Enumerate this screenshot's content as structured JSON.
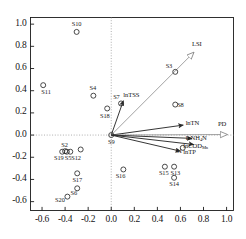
{
  "chart_data": {
    "type": "scatter",
    "title": "",
    "subtitle": "",
    "xlabel": "",
    "ylabel": "",
    "xlim": [
      -0.7,
      1.06
    ],
    "ylim": [
      -0.68,
      1.06
    ],
    "grid": "zero-axis dotted crosshair only",
    "legend": "none",
    "xticks": [
      "-0.6",
      "-0.4",
      "-0.2",
      "0.0",
      "0.2",
      "0.4",
      "0.6",
      "0.8",
      "1.0"
    ],
    "xtickvalues": [
      -0.6,
      -0.4,
      -0.2,
      0.0,
      0.2,
      0.4,
      0.6,
      0.8,
      1.0
    ],
    "yticks": [
      "1.0",
      "0.8",
      "0.6",
      "0.4",
      "0.2",
      "0.0",
      "-0.2",
      "-0.4",
      "-0.6"
    ],
    "ytickvalues": [
      1.0,
      0.8,
      0.6,
      0.4,
      0.2,
      0.0,
      -0.2,
      -0.4,
      -0.6
    ],
    "marker": "open-circle",
    "points": [
      {
        "label": "S10",
        "x": -0.3,
        "y": 0.93,
        "lx": -0.3,
        "ly": 1.0,
        "anchor": "center"
      },
      {
        "label": "S11",
        "x": -0.59,
        "y": 0.45,
        "lx": -0.565,
        "ly": 0.385,
        "anchor": "center"
      },
      {
        "label": "S4",
        "x": -0.155,
        "y": 0.355,
        "lx": -0.16,
        "ly": 0.425,
        "anchor": "center"
      },
      {
        "label": "S7",
        "x": 0.085,
        "y": 0.285,
        "lx": 0.045,
        "ly": 0.345,
        "anchor": "center"
      },
      {
        "label": "S18",
        "x": -0.035,
        "y": 0.24,
        "lx": -0.055,
        "ly": 0.175,
        "anchor": "center"
      },
      {
        "label": "S3",
        "x": 0.555,
        "y": 0.57,
        "lx": 0.5,
        "ly": 0.625,
        "anchor": "center"
      },
      {
        "label": "S8",
        "x": 0.555,
        "y": 0.275,
        "lx": 0.6,
        "ly": 0.275,
        "anchor": "center"
      },
      {
        "label": "S9",
        "x": 0.0,
        "y": 0.0,
        "lx": 0.0,
        "ly": -0.065,
        "anchor": "center"
      },
      {
        "label": "S1",
        "x": 0.62,
        "y": -0.115,
        "lx": 0.585,
        "ly": -0.145,
        "anchor": "center"
      },
      {
        "label": "S2",
        "x": -0.4,
        "y": -0.145,
        "lx": -0.405,
        "ly": -0.085,
        "anchor": "center"
      },
      {
        "label": "S19",
        "x": -0.425,
        "y": -0.15,
        "lx": -0.455,
        "ly": -0.205,
        "anchor": "center"
      },
      {
        "label": "S5",
        "x": -0.385,
        "y": -0.15,
        "lx": -0.375,
        "ly": -0.205,
        "anchor": "center"
      },
      {
        "label": "S12",
        "x": -0.355,
        "y": -0.15,
        "lx": -0.305,
        "ly": -0.205,
        "anchor": "center"
      },
      {
        "label": "S17",
        "x": -0.295,
        "y": -0.345,
        "lx": -0.295,
        "ly": -0.405,
        "anchor": "center"
      },
      {
        "label": "S16",
        "x": 0.105,
        "y": -0.31,
        "lx": 0.08,
        "ly": -0.37,
        "anchor": "center"
      },
      {
        "label": "S15",
        "x": 0.465,
        "y": -0.285,
        "lx": 0.455,
        "ly": -0.345,
        "anchor": "center"
      },
      {
        "label": "S13",
        "x": 0.545,
        "y": -0.285,
        "lx": 0.555,
        "ly": -0.345,
        "anchor": "center"
      },
      {
        "label": "S14",
        "x": 0.545,
        "y": -0.385,
        "lx": 0.545,
        "ly": -0.445,
        "anchor": "center"
      },
      {
        "label": "S6",
        "x": -0.295,
        "y": -0.48,
        "lx": -0.325,
        "ly": -0.525,
        "anchor": "center"
      },
      {
        "label": "S20",
        "x": -0.38,
        "y": -0.555,
        "lx": -0.445,
        "ly": -0.585,
        "anchor": "center"
      },
      {
        "label": "",
        "x": -0.265,
        "y": -0.13,
        "lx": -0.265,
        "ly": -0.13,
        "anchor": "center"
      }
    ],
    "extra_point_note": "unlabeled open circle right of the S2/S19/S5/S12 cluster",
    "vectors": [
      {
        "label": "lnTSS",
        "plain": "lnTSS",
        "x": 0.105,
        "y": 0.31,
        "head": "solid",
        "lx": 0.105,
        "ly": 0.355,
        "anchor": "start"
      },
      {
        "label": "LSI",
        "plain": "LSI",
        "x": 0.715,
        "y": 0.745,
        "head": "hollow",
        "lx": 0.7,
        "ly": 0.815,
        "anchor": "start"
      },
      {
        "label": "lnTN",
        "plain": "lnTN",
        "x": 0.625,
        "y": 0.09,
        "head": "solid",
        "lx": 0.645,
        "ly": 0.1,
        "anchor": "start"
      },
      {
        "label": "PD",
        "plain": "PD",
        "x": 1.005,
        "y": 0.005,
        "head": "hollow",
        "lx": 0.925,
        "ly": 0.095,
        "anchor": "start"
      },
      {
        "label": "lnNH4N",
        "plain": "lnNH₄N",
        "x": 0.7,
        "y": -0.03,
        "head": "solid",
        "lx": 0.645,
        "ly": -0.035,
        "anchor": "start"
      },
      {
        "label": "lnCOD",
        "plain": "lnCOD",
        "x": 0.715,
        "y": -0.085,
        "head": "solid",
        "lx": 0.625,
        "ly": -0.105,
        "anchor": "start"
      },
      {
        "label": "lnTP",
        "plain": "lnTP",
        "x": 0.6,
        "y": -0.145,
        "head": "solid",
        "lx": 0.625,
        "ly": -0.165,
        "anchor": "start"
      }
    ],
    "vector_label_html": {
      "lnTSS": "lnTSS",
      "LSI": "LSI",
      "lnTN": "lnTN",
      "PD": "PD",
      "lnNH4N": "lnNH<sub>4</sub>N",
      "lnCOD": "lnCOD<sub>Mn</sub>",
      "lnTP": "lnTP"
    },
    "colors": {
      "axis": "#1a1a1a",
      "marker_stroke": "#2b2b2b",
      "vector_solid": "#2b2b2b",
      "vector_hollow": "#8a8a8a",
      "grid_dotted": "#9a9a9a",
      "background": "#ffffff"
    }
  }
}
